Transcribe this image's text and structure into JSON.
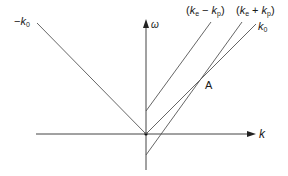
{
  "diagram": {
    "type": "dispersion-diagram",
    "axes": {
      "horizontal_label": "k",
      "vertical_label": "ω"
    },
    "lines": [
      {
        "id": "neg-k0",
        "label_prefix": "−",
        "label_main": "k",
        "label_sub": "0"
      },
      {
        "id": "ke-minus-kp",
        "label_open": "(",
        "label_a": "k",
        "label_a_sub": "e",
        "label_op": "−",
        "label_b": "k",
        "label_b_sub": "p",
        "label_close": ")"
      },
      {
        "id": "ke-plus-kp",
        "label_open": "(",
        "label_a": "k",
        "label_a_sub": "e",
        "label_op": "+",
        "label_b": "k",
        "label_b_sub": "p",
        "label_close": ")"
      },
      {
        "id": "k0",
        "label_main": "k",
        "label_sub": "0"
      }
    ],
    "points": [
      {
        "id": "A",
        "label": "A"
      }
    ],
    "colors": {
      "line": "#555555",
      "axis": "#333333",
      "text": "#1a1a1a"
    }
  }
}
